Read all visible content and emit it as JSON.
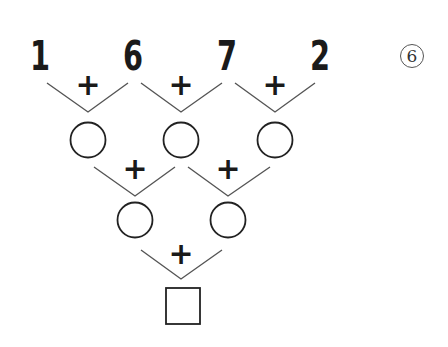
{
  "problem": {
    "label": "6",
    "top_numbers": [
      "1",
      "6",
      "7",
      "2"
    ],
    "operator": "+",
    "rows": [
      {
        "level": 1,
        "blanks": 3,
        "shape": "circle"
      },
      {
        "level": 2,
        "blanks": 2,
        "shape": "circle"
      },
      {
        "level": 3,
        "blanks": 1,
        "shape": "square"
      }
    ]
  },
  "colors": {
    "line": "#555555",
    "text": "#1a1a1a",
    "background": "#ffffff"
  }
}
